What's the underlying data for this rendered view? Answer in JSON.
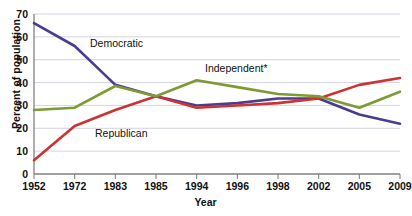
{
  "chart_data": {
    "type": "line",
    "title": "",
    "xlabel": "Year",
    "ylabel": "Percent of population",
    "categories": [
      "1952",
      "1972",
      "1983",
      "1985",
      "1994",
      "1996",
      "1998",
      "2002",
      "2005",
      "2009"
    ],
    "ylim": [
      0,
      70
    ],
    "yticks": [
      "0",
      "10",
      "20",
      "30",
      "40",
      "50",
      "60",
      "70"
    ],
    "grid": "horizontal",
    "legend": "inline-annotations",
    "series": [
      {
        "name": "Democratic",
        "color": "#4c3b8f",
        "values": [
          66,
          56,
          39,
          34,
          30,
          31,
          33,
          33,
          26,
          22
        ]
      },
      {
        "name": "Republican",
        "color": "#cc3333",
        "values": [
          6,
          21,
          28,
          34,
          29,
          30,
          31,
          33,
          39,
          42
        ]
      },
      {
        "name": "Independent*",
        "color": "#7d9b33",
        "values": [
          28,
          29,
          38.5,
          34,
          41,
          38,
          35,
          34,
          29,
          36
        ]
      }
    ],
    "annotations": [
      {
        "text": "Democratic",
        "series": "Democratic"
      },
      {
        "text": "Republican",
        "series": "Republican"
      },
      {
        "text": "Independent*",
        "series": "Independent*"
      }
    ]
  },
  "axes": {
    "y_title": "Percent of population",
    "x_title": "Year"
  }
}
